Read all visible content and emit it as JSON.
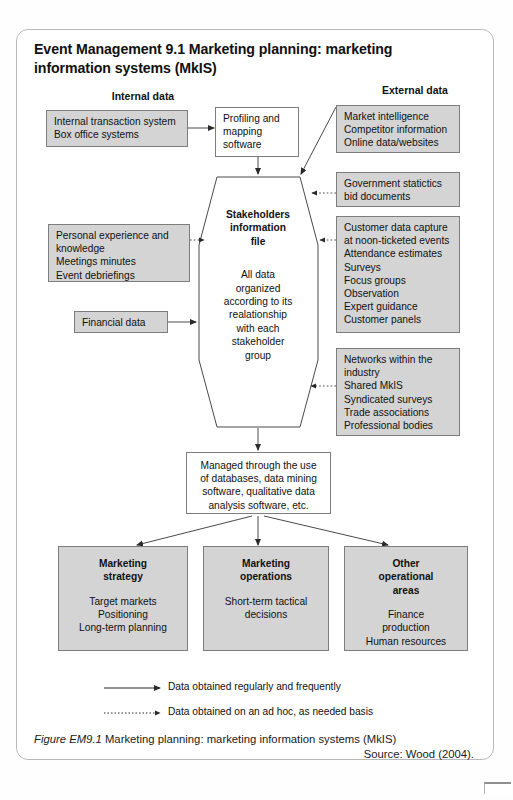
{
  "title": "Event Management 9.1  Marketing planning: marketing information systems (MkIS)",
  "headings": {
    "internal": "Internal data",
    "external": "External data"
  },
  "boxes": {
    "internal_transaction": "Internal transaction system\nBox office systems",
    "profiling": "Profiling and mapping software",
    "market_intelligence": "Market intelligence\nCompetitor information\nOnline data/websites",
    "government": "Government statictics\nbid documents",
    "customer_capture": "Customer data capture\nat noon-ticketed events\nAttendance estimates\nSurveys\nFocus groups\nObservation\nExpert guidance\nCustomer panels",
    "networks": "Networks within the\nindustry\nShared MkIS\nSyndicated surveys\nTrade associations\nProfessional bodies",
    "personal_experience": "Personal experience and knowledge\nMeetings minutes\nEvent debriefings",
    "financial_data": "Financial data",
    "managed_through": "Managed through the use of databases, data mining software, qualitative data analysis software, etc."
  },
  "hexagon": {
    "title": "Stakeholders\ninformation\nfile",
    "body": "All data\norganized\naccording to its\nrealationship\nwith each\nstakeholder\ngroup"
  },
  "outputs": [
    {
      "title": "Marketing\nstrategy",
      "body": "Target markets\nPositioning\nLong-term planning"
    },
    {
      "title": "Marketing\noperations",
      "body": "Short-term tactical\ndecisions"
    },
    {
      "title": "Other\noperational\nareas",
      "body": "Finance\nproduction\nHuman resources"
    }
  ],
  "legend": [
    {
      "style": "solid",
      "label": "Data obtained regularly and frequently"
    },
    {
      "style": "dotted",
      "label": "Data obtained on an ad hoc, as needed basis"
    }
  ],
  "caption": {
    "figure_label": "Figure EM9.1",
    "text": "  Marketing planning: marketing information systems (MkIS)",
    "source": "Source: Wood (2004)."
  },
  "colors": {
    "box_fill_gray": "#d4d4d4",
    "box_fill_white": "#ffffff",
    "stroke": "#7d7d7d",
    "text": "#111111"
  }
}
